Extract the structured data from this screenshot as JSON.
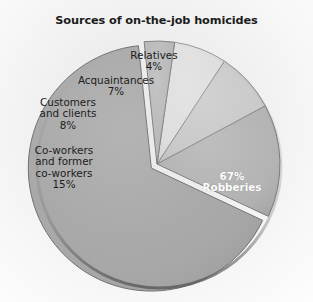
{
  "figure": {
    "title": "Sources of on-the-job homicides",
    "background_color": "#f1f1f1",
    "width": 313,
    "height": 302
  },
  "chart_data": {
    "type": "pie",
    "title": "Sources of on-the-job homicides",
    "xlabel": "",
    "ylabel": "",
    "units": "percent",
    "total": 101,
    "legend_position": "none",
    "grid": false,
    "categories": [
      "Robberies",
      "Co-workers and former co-workers",
      "Customers and clients",
      "Acquaintances",
      "Relatives"
    ],
    "values": [
      67,
      15,
      8,
      7,
      4
    ],
    "labels": [
      "67%",
      "15%",
      "8%",
      "7%",
      "4%"
    ],
    "slices": [
      {
        "name": "Robberies",
        "label": "Robberies",
        "value": 67,
        "percent_text": "67%",
        "color": "#a6a6a6",
        "edge_color": "#6f6f6f",
        "exploded": true,
        "label_placement": "inside",
        "label_color": "#fdfdfd"
      },
      {
        "name": "Co-workers and former co-workers",
        "label": "Co-workers\nand former\nco-workers",
        "value": 15,
        "percent_text": "15%",
        "color": "#b2b2b2",
        "edge_color": "#7a7a7a",
        "exploded": false,
        "label_placement": "outside",
        "label_color": "#1c1c1c"
      },
      {
        "name": "Customers and clients",
        "label": "Customers\nand clients",
        "value": 8,
        "percent_text": "8%",
        "color": "#c9c9c9",
        "edge_color": "#8a8a8a",
        "exploded": false,
        "label_placement": "outside",
        "label_color": "#1c1c1c"
      },
      {
        "name": "Acquaintances",
        "label": "Acquaintances",
        "value": 7,
        "percent_text": "7%",
        "color": "#dedede",
        "edge_color": "#949494",
        "exploded": false,
        "label_placement": "outside",
        "label_color": "#1c1c1c"
      },
      {
        "name": "Relatives",
        "label": "Relatives",
        "value": 4,
        "percent_text": "4%",
        "color": "#b8b8b8",
        "edge_color": "#808080",
        "exploded": false,
        "label_placement": "outside",
        "label_color": "#1c1c1c"
      }
    ],
    "geometry": {
      "center_x": 157,
      "center_y": 164,
      "radius": 123,
      "start_angle_deg": -96,
      "direction": "counterclockwise",
      "explode_offset_px": 7
    }
  }
}
